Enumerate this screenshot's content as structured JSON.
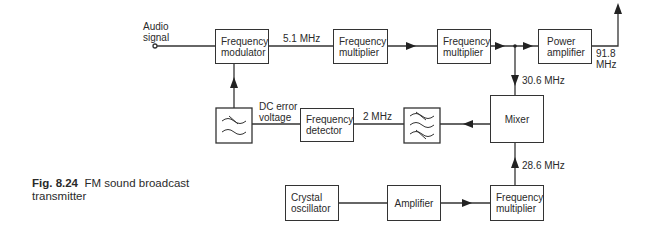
{
  "diagram": {
    "type": "block-diagram",
    "blocks": {
      "freq_modulator": "Frequency\nmodulator",
      "freq_multiplier_1": "Frequency\nmultiplier",
      "freq_multiplier_2": "Frequency\nmultiplier",
      "power_amplifier": "Power\namplifier",
      "lowpass_filter": "low-pass filter",
      "freq_detector": "Frequency\ndetector",
      "bandpass_filter": "band-pass filter",
      "mixer": "Mixer",
      "crystal_oscillator": "Crystal\noscillator",
      "amplifier": "Amplifier",
      "freq_multiplier_3": "Frequency\nmultiplier"
    },
    "labels": {
      "audio_signal": "Audio\nsignal",
      "f_5_1": "5.1 MHz",
      "f_91_8": "91.8\nMHz",
      "f_30_6": "30.6 MHz",
      "dc_error": "DC error\nvoltage",
      "f_2": "2 MHz",
      "f_28_6": "28.6 MHz"
    },
    "caption": {
      "number": "Fig. 8.24",
      "text": "FM sound broadcast\ntransmitter"
    }
  }
}
